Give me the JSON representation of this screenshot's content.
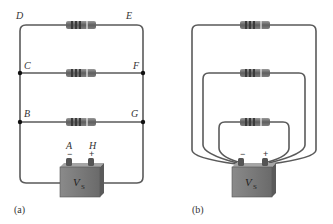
{
  "figure": {
    "panel_a": {
      "caption": "(a)",
      "nodes": {
        "D": "D",
        "E": "E",
        "C": "C",
        "F": "F",
        "B": "B",
        "G": "G",
        "A": "A",
        "H": "H"
      },
      "battery": {
        "label": "V",
        "subscript": "S",
        "minus": "−",
        "plus": "+"
      },
      "resistor_count": 3
    },
    "panel_b": {
      "caption": "(b)",
      "battery": {
        "label": "V",
        "subscript": "S",
        "minus": "−",
        "plus": "+"
      },
      "resistor_count": 3
    },
    "colors": {
      "wire": "#5a5a5a",
      "resistor_body": "#6b6b6b",
      "resistor_band": "#3a3a3a",
      "battery_body": "#7a7a7a",
      "battery_top": "#9a9a9a",
      "node_dot": "#111111"
    }
  }
}
